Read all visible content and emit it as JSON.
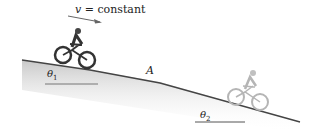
{
  "figure": {
    "velocity_label": {
      "symbol": "v",
      "text": " = constant"
    },
    "point_label": "A",
    "angle1": {
      "symbol": "θ",
      "sub": "1"
    },
    "angle2": {
      "symbol": "θ",
      "sub": "2"
    },
    "colors": {
      "road": "#444444",
      "shade": "#bfbfbf",
      "rider1": "#333333",
      "rider2": "#b5b5b5"
    }
  }
}
